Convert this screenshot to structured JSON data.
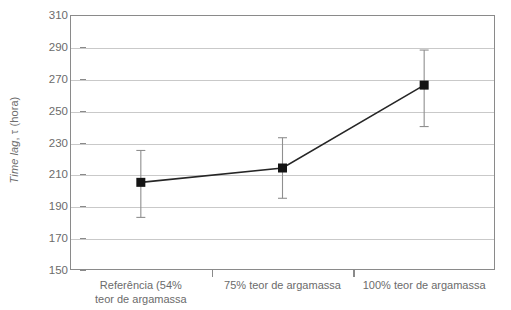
{
  "chart_data": {
    "type": "line",
    "title": "",
    "xlabel": "",
    "ylabel": "Time lag, τ (hora)",
    "ylabel_italic_part": "Time lag",
    "ylabel_rest": ", τ (hora)",
    "categories": [
      "Referência (54%\nteor de argamassa",
      "75% teor de argamassa",
      "100% teor de argamassa"
    ],
    "values": [
      205,
      214,
      266
    ],
    "error_upper": [
      225,
      233,
      288
    ],
    "error_lower": [
      183,
      195,
      240
    ],
    "ylim": [
      150,
      310
    ],
    "ytick_values": [
      150,
      170,
      190,
      210,
      230,
      250,
      270,
      290,
      310
    ],
    "ytick_labels": [
      "150",
      "170",
      "190",
      "210",
      "230",
      "250",
      "270",
      "290",
      "310"
    ],
    "grid": true,
    "legend": "none",
    "marker": "square",
    "marker_color": "#141414",
    "line_color": "#262626",
    "errorbar_color": "#8f8f8f",
    "gridline_color": "#c9c9c9",
    "axis_color": "#8a8a8a",
    "text_color": "#6b6b6b",
    "background": "#ffffff"
  }
}
